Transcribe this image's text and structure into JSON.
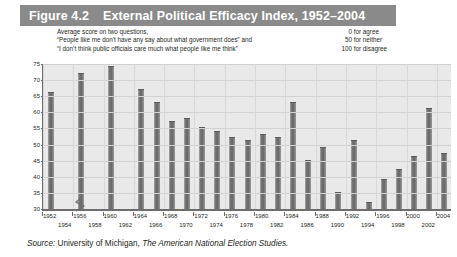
{
  "figure": {
    "number": "Figure 4.2",
    "title": "External Political Efficacy Index, 1952–2004"
  },
  "caption": {
    "lines": [
      "Average score on two questions,",
      "“People like me don’t have any say about what government does” and",
      "“I don’t think public officials care much what people like me think”"
    ],
    "scale": [
      {
        "value": "0",
        "label": "for agree"
      },
      {
        "value": "50",
        "label": "for neither"
      },
      {
        "value": "100",
        "label": "for disagree"
      }
    ]
  },
  "source": {
    "lead": "Source:",
    "text": " University of Michigan, ",
    "italic": "The American National Election Studies."
  },
  "chart_data": {
    "type": "bar",
    "title": "External Political Efficacy Index, 1952–2004",
    "xlabel": "",
    "ylabel": "Average score",
    "ylim": [
      30,
      75
    ],
    "yticks": [
      30,
      35,
      40,
      45,
      50,
      55,
      60,
      65,
      70,
      75
    ],
    "grid": true,
    "axis_break": true,
    "legend": "none",
    "categories": [
      "1952",
      "1954",
      "1956",
      "1958",
      "1960",
      "1962",
      "1964",
      "1966",
      "1968",
      "1970",
      "1972",
      "1974",
      "1976",
      "1978",
      "1980",
      "1982",
      "1984",
      "1986",
      "1988",
      "1990",
      "1992",
      "1994",
      "1996",
      "1998",
      "2000",
      "2002",
      "2004"
    ],
    "values": [
      66,
      null,
      72,
      null,
      74,
      null,
      67,
      63,
      57,
      58,
      55,
      54,
      52,
      51,
      53,
      52,
      63,
      45,
      49,
      35,
      51,
      32,
      39,
      42,
      46,
      61,
      47
    ],
    "series": [
      {
        "name": "Average score",
        "values": [
          66,
          null,
          72,
          null,
          74,
          null,
          67,
          63,
          57,
          58,
          55,
          54,
          52,
          51,
          53,
          52,
          63,
          45,
          49,
          35,
          51,
          32,
          39,
          42,
          46,
          61,
          47
        ]
      }
    ],
    "bar_color": "#6f6f6f",
    "plot_background": "#e9e9e9"
  }
}
